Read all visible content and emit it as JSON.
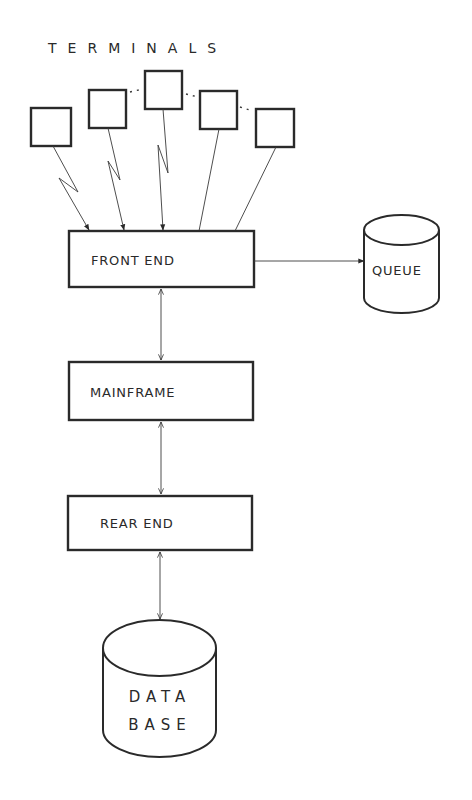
{
  "diagram": {
    "title": "TERMINALS",
    "terminals": [
      {
        "id": "t1",
        "connection": "wireless"
      },
      {
        "id": "t2",
        "connection": "wireless"
      },
      {
        "id": "t3",
        "connection": "wireless"
      },
      {
        "id": "t4",
        "connection": "wired"
      },
      {
        "id": "t5",
        "connection": "wired"
      }
    ],
    "nodes": {
      "front_end": "FRONT END",
      "mainframe": "MAINFRAME",
      "rear_end": "REAR END",
      "queue": "QUEUE",
      "database_line1": "DATA",
      "database_line2": "BASE"
    },
    "edges": [
      {
        "from": "terminals",
        "to": "front_end",
        "direction": "one-way"
      },
      {
        "from": "front_end",
        "to": "queue",
        "direction": "one-way"
      },
      {
        "from": "front_end",
        "to": "mainframe",
        "direction": "two-way"
      },
      {
        "from": "mainframe",
        "to": "rear_end",
        "direction": "two-way"
      },
      {
        "from": "rear_end",
        "to": "database",
        "direction": "two-way"
      }
    ],
    "colors": {
      "background": "#ffffff",
      "ink": "#2a2a2a"
    }
  }
}
